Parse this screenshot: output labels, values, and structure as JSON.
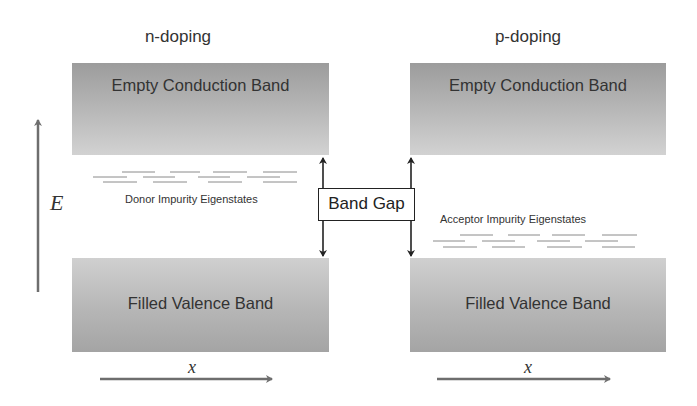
{
  "diagram": {
    "panels": [
      {
        "title": "n-doping",
        "conduction_band": "Empty Conduction Band",
        "valence_band": "Filled Valence Band",
        "impurity_label": "Donor Impurity Eigenstates",
        "impurity_position": "near conduction band"
      },
      {
        "title": "p-doping",
        "conduction_band": "Empty Conduction Band",
        "valence_band": "Filled Valence Band",
        "impurity_label": "Acceptor Impurity Eigenstates",
        "impurity_position": "near valence band"
      }
    ],
    "band_gap_label": "Band Gap",
    "energy_axis_label": "E",
    "position_axis_label": "x",
    "colors": {
      "band_dark": "#9c9c9c",
      "band_light": "#d2d2d2",
      "arrow_gray": "#6e6e6e",
      "arrow_black": "#222222",
      "impurity_lines": "#888888"
    }
  }
}
